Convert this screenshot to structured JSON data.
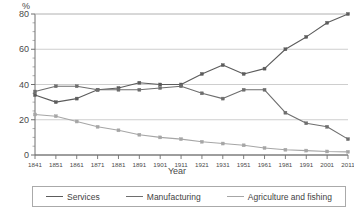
{
  "chart_data": {
    "type": "line",
    "title": "",
    "subtitle": "",
    "xlabel": "Year",
    "ylabel": "%",
    "ylim": [
      0,
      80
    ],
    "yticks": [
      0,
      20,
      40,
      60,
      80
    ],
    "yminor_step": 5,
    "grid": "horizontal",
    "legend_position": "bottom",
    "x": [
      1841,
      1851,
      1861,
      1871,
      1881,
      1891,
      1901,
      1911,
      1921,
      1931,
      1951,
      1961,
      1981,
      1991,
      2001,
      2011
    ],
    "categories": [
      "1841",
      "1851",
      "1861",
      "1871",
      "1881",
      "1891",
      "1901",
      "1911",
      "1921",
      "1931",
      "1951",
      "1961",
      "1981",
      "1991",
      "2001",
      "2011"
    ],
    "tick_labels": [
      "1841",
      "1851",
      "1861",
      "1871",
      "1881",
      "1891",
      "1901",
      "1911",
      "1921",
      "1931",
      "1951",
      "1961",
      "1981",
      "1991",
      "2001",
      "2011"
    ],
    "series": [
      {
        "name": "Services",
        "color": "#5c5c5c",
        "values": [
          34,
          30,
          32,
          37,
          38,
          41,
          40,
          40,
          46,
          51,
          46,
          49,
          60,
          67,
          75,
          80
        ]
      },
      {
        "name": "Manufacturing",
        "color": "#6e6e6e",
        "values": [
          36,
          39,
          39,
          37,
          37,
          37,
          38,
          39,
          35,
          32,
          37,
          37,
          24,
          18,
          16,
          9
        ]
      },
      {
        "name": "Agriculture and fishing",
        "color": "#a6a6a6",
        "values": [
          23,
          22,
          19,
          16,
          14,
          11.5,
          10,
          9,
          7.5,
          6.5,
          5.5,
          4,
          3,
          2.5,
          2,
          1.8
        ]
      }
    ]
  },
  "legend": {
    "items": [
      {
        "label": "Services",
        "color": "#5c5c5c"
      },
      {
        "label": "Manufacturing",
        "color": "#6e6e6e"
      },
      {
        "label": "Agriculture and fishing",
        "color": "#a6a6a6"
      }
    ]
  },
  "axes": {
    "y_unit": "%",
    "x_title": "Year"
  }
}
